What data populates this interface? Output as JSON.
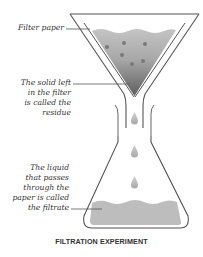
{
  "diagram": {
    "title": "FILTRATION EXPERIMENT",
    "labels": {
      "filter_paper": "Filter paper",
      "residue": "The solid left\nin the filter\nis called the\nresidue",
      "filtrate": "The liquid\nthat passes\nthrough the\npaper is called\nthe filtrate"
    },
    "components": [
      "funnel",
      "filter-paper",
      "residue",
      "droplets",
      "conical-flask",
      "filtrate"
    ],
    "colors": {
      "outline": "#555555",
      "residue_light": "#b8b8b8",
      "residue_dark": "#6a6a6a",
      "particle": "#777777",
      "filtrate": "#bdbdbd",
      "droplet": "#bbbbbb",
      "text": "#333333"
    },
    "droplet_count": 3,
    "particle_count": 6
  }
}
